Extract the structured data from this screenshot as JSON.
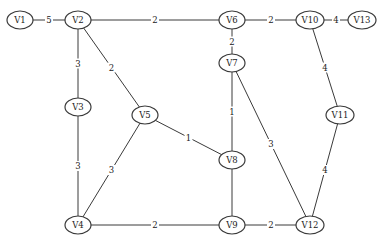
{
  "graph": {
    "nodes": [
      {
        "id": "V1",
        "label": "V1",
        "x": 20,
        "y": 20
      },
      {
        "id": "V2",
        "label": "V2",
        "x": 78,
        "y": 20
      },
      {
        "id": "V6",
        "label": "V6",
        "x": 232,
        "y": 20
      },
      {
        "id": "V10",
        "label": "V10",
        "x": 310,
        "y": 20
      },
      {
        "id": "V13",
        "label": "V13",
        "x": 362,
        "y": 20
      },
      {
        "id": "V3",
        "label": "V3",
        "x": 78,
        "y": 107
      },
      {
        "id": "V5",
        "label": "V5",
        "x": 145,
        "y": 115
      },
      {
        "id": "V7",
        "label": "V7",
        "x": 232,
        "y": 63
      },
      {
        "id": "V8",
        "label": "V8",
        "x": 232,
        "y": 160
      },
      {
        "id": "V11",
        "label": "V11",
        "x": 340,
        "y": 115
      },
      {
        "id": "V4",
        "label": "V4",
        "x": 78,
        "y": 225
      },
      {
        "id": "V9",
        "label": "V9",
        "x": 232,
        "y": 225
      },
      {
        "id": "V12",
        "label": "V12",
        "x": 310,
        "y": 225
      }
    ],
    "edges": [
      {
        "from": "V1",
        "to": "V2",
        "weight": "5"
      },
      {
        "from": "V2",
        "to": "V6",
        "weight": "2"
      },
      {
        "from": "V6",
        "to": "V10",
        "weight": "2"
      },
      {
        "from": "V10",
        "to": "V13",
        "weight": "4"
      },
      {
        "from": "V2",
        "to": "V3",
        "weight": "3"
      },
      {
        "from": "V2",
        "to": "V5",
        "weight": "2"
      },
      {
        "from": "V6",
        "to": "V7",
        "weight": "2"
      },
      {
        "from": "V10",
        "to": "V11",
        "weight": "4"
      },
      {
        "from": "V3",
        "to": "V4",
        "weight": "3"
      },
      {
        "from": "V5",
        "to": "V8",
        "weight": "1"
      },
      {
        "from": "V5",
        "to": "V4",
        "weight": "3"
      },
      {
        "from": "V7",
        "to": "V8",
        "weight": "1"
      },
      {
        "from": "V7",
        "to": "V12",
        "weight": "3"
      },
      {
        "from": "V11",
        "to": "V12",
        "weight": "4"
      },
      {
        "from": "V8",
        "to": "V9",
        "weight": ""
      },
      {
        "from": "V4",
        "to": "V9",
        "weight": "2"
      },
      {
        "from": "V9",
        "to": "V12",
        "weight": "2"
      }
    ]
  }
}
